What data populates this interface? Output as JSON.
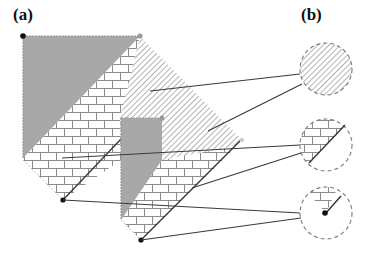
{
  "panels": {
    "a": {
      "label": "(a)"
    },
    "b": {
      "label": "(b)"
    }
  },
  "colors": {
    "gray_fill": "#a8a8a8",
    "line": "#3a3a3a",
    "hatch": "#8a8a8a",
    "brick": "#8c8c8c",
    "dot_black": "#111111",
    "dot_gray": "#9a9a9a",
    "dashed_circle": "#7a7a7a"
  },
  "legend_circles": [
    {
      "name": "hatched-region-detail",
      "pattern": "hatch"
    },
    {
      "name": "brick-edge-detail",
      "pattern": "brick-with-edge"
    },
    {
      "name": "brick-vertex-detail",
      "pattern": "brick-with-vertex"
    }
  ]
}
